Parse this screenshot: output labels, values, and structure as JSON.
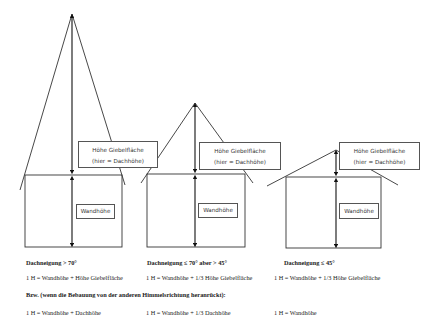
{
  "houses": [
    {
      "id": "house-1",
      "gable_label_line1": "Höhe Giebelfläche",
      "gable_label_line2": "(hier = Dachhöhe)",
      "wall_label": "Wandhöhe",
      "heading": "Dachneigung > 70°",
      "formula": "1 H = Wandhöhe + Höhe Giebelfläche",
      "alt_formula": "1 H = Wandhöhe + Dachhöhe"
    },
    {
      "id": "house-2",
      "gable_label_line1": "Höhe Giebelfläche",
      "gable_label_line2": "(hier = Dachhöhe)",
      "wall_label": "Wandhöhe",
      "heading": "Dachneigung ≤ 70° aber > 45°",
      "formula": "1 H = Wandhöhe + 1/3 Höhe Giebelfläche",
      "alt_formula": "1 H = Wandhöhe + 1/3 Dachhöhe"
    },
    {
      "id": "house-3",
      "gable_label_line1": "Höhe Giebelfläche",
      "gable_label_line2": "(hier = Dachhöhe)",
      "wall_label": "Wandhöhe",
      "heading": "Dachneigung ≤ 45°",
      "formula": "1 H = Wandhöhe + 1/3 Höhe Giebelfläche",
      "alt_formula": "1 H = Wandhöhe"
    }
  ],
  "alt_heading": "Bzw. (wenn die Bebauung von der anderen Himmelsrichtung heranrückt):",
  "colors": {
    "line": "#333333",
    "box_border": "#555555",
    "background": "#ffffff"
  }
}
